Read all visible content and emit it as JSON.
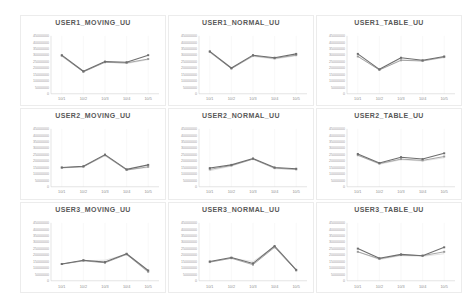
{
  "page": {
    "background": "#ffffff",
    "grid": {
      "rows": 3,
      "cols": 3
    }
  },
  "colors": {
    "panel_border": "#ececec",
    "title_text": "#595959",
    "tick_text": "#9a9a9a",
    "axis_line": "#c9c9c9",
    "gridline": "#f0f0f0",
    "series1": "#6e6e6e",
    "series2": "#9a9a9a",
    "series3": "#c6c6c6"
  },
  "chart_data": [
    {
      "type": "line",
      "title": "USER1_MOVING_UU",
      "categories": [
        "10/1",
        "10/2",
        "10/3",
        "10/4",
        "10/5"
      ],
      "ylim": [
        0,
        45000000
      ],
      "yticks": [
        "45000000",
        "40000000",
        "35000000",
        "30000000",
        "25000000",
        "20000000",
        "15000000",
        "10000000",
        "5000000",
        "0"
      ],
      "grid": true,
      "legend": "none",
      "series": [
        {
          "values": [
            30000000,
            17500000,
            25000000,
            24500000,
            30000000
          ]
        },
        {
          "values": [
            29500000,
            17000000,
            24500000,
            24000000,
            27000000
          ]
        },
        {
          "values": [
            29000000,
            17000000,
            24500000,
            23500000,
            26500000
          ]
        }
      ]
    },
    {
      "type": "line",
      "title": "USER1_NORMAL_UU",
      "categories": [
        "10/1",
        "10/2",
        "10/3",
        "10/4",
        "10/5"
      ],
      "ylim": [
        0,
        45000000
      ],
      "yticks": [
        "45000000",
        "40000000",
        "35000000",
        "30000000",
        "25000000",
        "20000000",
        "15000000",
        "10000000",
        "5000000",
        "0"
      ],
      "grid": true,
      "legend": "none",
      "series": [
        {
          "values": [
            33000000,
            20000000,
            30000000,
            28000000,
            31000000
          ]
        },
        {
          "values": [
            32500000,
            19500000,
            29500000,
            27500000,
            30000000
          ]
        },
        {
          "values": [
            32000000,
            19500000,
            29000000,
            27000000,
            29500000
          ]
        }
      ]
    },
    {
      "type": "line",
      "title": "USER1_TABLE_UU",
      "categories": [
        "10/1",
        "10/2",
        "10/3",
        "10/4",
        "10/5"
      ],
      "ylim": [
        0,
        45000000
      ],
      "yticks": [
        "45000000",
        "40000000",
        "35000000",
        "30000000",
        "25000000",
        "20000000",
        "15000000",
        "10000000",
        "5000000",
        "0"
      ],
      "grid": true,
      "legend": "none",
      "series": [
        {
          "values": [
            31000000,
            19000000,
            28000000,
            26000000,
            29000000
          ]
        },
        {
          "values": [
            29000000,
            18500000,
            26000000,
            25500000,
            28500000
          ]
        },
        {
          "values": [
            29500000,
            18500000,
            26500000,
            25500000,
            28000000
          ]
        }
      ]
    },
    {
      "type": "line",
      "title": "USER2_MOVING_UU",
      "categories": [
        "10/1",
        "10/2",
        "10/3",
        "10/4",
        "10/5"
      ],
      "ylim": [
        0,
        45000000
      ],
      "yticks": [
        "45000000",
        "40000000",
        "35000000",
        "30000000",
        "25000000",
        "20000000",
        "15000000",
        "10000000",
        "5000000",
        "0"
      ],
      "grid": true,
      "legend": "none",
      "series": [
        {
          "values": [
            15000000,
            16000000,
            25000000,
            13500000,
            17000000
          ]
        },
        {
          "values": [
            14800000,
            15500000,
            24500000,
            13000000,
            15500000
          ]
        },
        {
          "values": [
            14500000,
            15500000,
            24000000,
            13000000,
            15000000
          ]
        }
      ]
    },
    {
      "type": "line",
      "title": "USER2_NORMAL_UU",
      "categories": [
        "10/1",
        "10/2",
        "10/3",
        "10/4",
        "10/5"
      ],
      "ylim": [
        0,
        45000000
      ],
      "yticks": [
        "45000000",
        "40000000",
        "35000000",
        "30000000",
        "25000000",
        "20000000",
        "15000000",
        "10000000",
        "5000000",
        "0"
      ],
      "grid": true,
      "legend": "none",
      "series": [
        {
          "values": [
            14500000,
            17000000,
            22000000,
            15000000,
            14000000
          ]
        },
        {
          "values": [
            13500000,
            16500000,
            21500000,
            14500000,
            13500000
          ]
        },
        {
          "values": [
            12500000,
            16000000,
            21500000,
            14000000,
            13500000
          ]
        }
      ]
    },
    {
      "type": "line",
      "title": "USER2_TABLE_UU",
      "categories": [
        "10/1",
        "10/2",
        "10/3",
        "10/4",
        "10/5"
      ],
      "ylim": [
        0,
        45000000
      ],
      "yticks": [
        "45000000",
        "40000000",
        "35000000",
        "30000000",
        "25000000",
        "20000000",
        "15000000",
        "10000000",
        "5000000",
        "0"
      ],
      "grid": true,
      "legend": "none",
      "series": [
        {
          "values": [
            25500000,
            18500000,
            23000000,
            21500000,
            26000000
          ]
        },
        {
          "values": [
            24500000,
            18000000,
            21500000,
            20500000,
            23500000
          ]
        },
        {
          "values": [
            24500000,
            17500000,
            21000000,
            20000000,
            22500000
          ]
        }
      ]
    },
    {
      "type": "line",
      "title": "USER3_MOVING_UU",
      "categories": [
        "10/1",
        "10/2",
        "10/3",
        "10/4",
        "10/5"
      ],
      "ylim": [
        0,
        45000000
      ],
      "yticks": [
        "45000000",
        "40000000",
        "35000000",
        "30000000",
        "25000000",
        "20000000",
        "15000000",
        "10000000",
        "5000000",
        "0"
      ],
      "grid": true,
      "legend": "none",
      "series": [
        {
          "values": [
            13000000,
            16000000,
            14500000,
            21000000,
            8000000
          ]
        },
        {
          "values": [
            13000000,
            15500000,
            14000000,
            20500000,
            7000000
          ]
        },
        {
          "values": [
            12800000,
            15500000,
            16000000,
            20500000,
            6500000
          ]
        }
      ]
    },
    {
      "type": "line",
      "title": "USER3_NORMAL_UU",
      "categories": [
        "10/1",
        "10/2",
        "10/3",
        "10/4",
        "10/5"
      ],
      "ylim": [
        0,
        45000000
      ],
      "yticks": [
        "45000000",
        "40000000",
        "35000000",
        "30000000",
        "25000000",
        "20000000",
        "15000000",
        "10000000",
        "5000000",
        "0"
      ],
      "grid": true,
      "legend": "none",
      "series": [
        {
          "values": [
            15000000,
            18000000,
            13500000,
            27000000,
            8500000
          ]
        },
        {
          "values": [
            14500000,
            17500000,
            12500000,
            26000000,
            8000000
          ]
        },
        {
          "values": [
            14500000,
            17500000,
            15000000,
            26500000,
            8000000
          ]
        }
      ]
    },
    {
      "type": "line",
      "title": "USER3_TABLE_UU",
      "categories": [
        "10/1",
        "10/2",
        "10/3",
        "10/4",
        "10/5"
      ],
      "ylim": [
        0,
        45000000
      ],
      "yticks": [
        "45000000",
        "40000000",
        "35000000",
        "30000000",
        "25000000",
        "20000000",
        "15000000",
        "10000000",
        "5000000",
        "0"
      ],
      "grid": true,
      "legend": "none",
      "series": [
        {
          "values": [
            25000000,
            17500000,
            20500000,
            19500000,
            26000000
          ]
        },
        {
          "values": [
            22500000,
            17000000,
            20000000,
            19500000,
            22500000
          ]
        },
        {
          "values": [
            22500000,
            16500000,
            19500000,
            19000000,
            21000000
          ]
        }
      ]
    }
  ]
}
